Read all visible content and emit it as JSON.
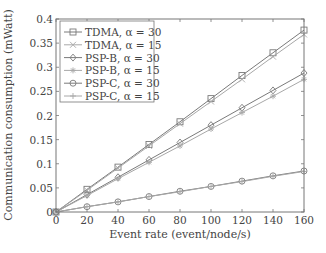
{
  "chart_data": {
    "type": "line",
    "title": "",
    "xlabel": "Event rate (event/node/s)",
    "ylabel": "Communication consumption (mWatt)",
    "xlim": [
      0,
      160
    ],
    "ylim": [
      0,
      0.4
    ],
    "xticks": [
      0,
      20,
      40,
      60,
      80,
      100,
      120,
      140,
      160
    ],
    "yticks": [
      0,
      0.05,
      0.1,
      0.15,
      0.2,
      0.25,
      0.3,
      0.35,
      0.4
    ],
    "ytick_labels": [
      "0",
      "0.05",
      "0.1",
      "0.15",
      "0.2",
      "0.25",
      "0.3",
      "0.35",
      "0.4"
    ],
    "grid": false,
    "legend_position": "upper left",
    "x": [
      0,
      20,
      40,
      60,
      80,
      100,
      120,
      140,
      160
    ],
    "series": [
      {
        "name": "TDMA, α = 30",
        "marker": "square",
        "values": [
          0,
          0.047,
          0.093,
          0.14,
          0.187,
          0.235,
          0.283,
          0.33,
          0.377
        ]
      },
      {
        "name": "TDMA, α = 15",
        "marker": "x",
        "values": [
          0,
          0.045,
          0.091,
          0.137,
          0.183,
          0.229,
          0.275,
          0.322,
          0.368
        ]
      },
      {
        "name": "PSP-B, α = 30",
        "marker": "diamond",
        "values": [
          0,
          0.036,
          0.072,
          0.108,
          0.144,
          0.18,
          0.216,
          0.252,
          0.288
        ]
      },
      {
        "name": "PSP-B, α = 15",
        "marker": "star",
        "values": [
          0,
          0.034,
          0.069,
          0.103,
          0.137,
          0.172,
          0.206,
          0.24,
          0.275
        ]
      },
      {
        "name": "PSP-C, α = 30",
        "marker": "circle",
        "values": [
          0,
          0.011,
          0.021,
          0.032,
          0.043,
          0.053,
          0.064,
          0.075,
          0.085
        ]
      },
      {
        "name": "PSP-C, α = 15",
        "marker": "plus",
        "values": [
          0,
          0.011,
          0.021,
          0.032,
          0.042,
          0.053,
          0.063,
          0.074,
          0.084
        ]
      }
    ]
  },
  "style": {
    "axis_color": "#777777",
    "line_color": "#7a7a7a",
    "light_line_color": "#a8a8a8",
    "text_color": "#444444"
  }
}
